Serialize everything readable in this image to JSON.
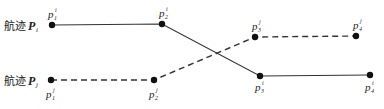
{
  "diagram": {
    "trajectory_i": {
      "label_prefix": "航迹",
      "label_symbol": "P",
      "label_sub": "i",
      "line_style": "solid",
      "color": "#333333",
      "points": [
        {
          "name": "p",
          "sub": "1",
          "sup": "i",
          "x": 52,
          "y": 25
        },
        {
          "name": "p",
          "sub": "2",
          "sup": "i",
          "x": 162,
          "y": 24
        },
        {
          "name": "p",
          "sub": "3",
          "sup": "i",
          "x": 260,
          "y": 76
        },
        {
          "name": "p",
          "sub": "4",
          "sup": "i",
          "x": 370,
          "y": 75
        }
      ]
    },
    "trajectory_j": {
      "label_prefix": "航迹",
      "label_symbol": "P",
      "label_sub": "j",
      "line_style": "dashed",
      "color": "#333333",
      "points": [
        {
          "name": "p",
          "sub": "1",
          "sup": "j",
          "x": 51,
          "y": 80
        },
        {
          "name": "p",
          "sub": "2",
          "sup": "j",
          "x": 154,
          "y": 80
        },
        {
          "name": "p",
          "sub": "3",
          "sup": "j",
          "x": 255,
          "y": 37
        },
        {
          "name": "p",
          "sub": "4",
          "sup": "j",
          "x": 356,
          "y": 36
        }
      ]
    }
  }
}
